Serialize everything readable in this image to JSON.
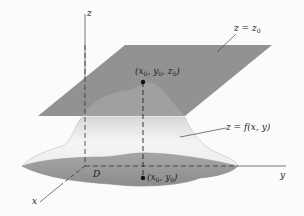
{
  "figure": {
    "type": "3d-surface-diagram",
    "axes": {
      "z_label": "z",
      "y_label": "y",
      "x_label": "x"
    },
    "plane_label": {
      "lhs": "z = z",
      "sub": "0"
    },
    "surface_label": "z = f(x, y)",
    "domain_label": "D",
    "max_point_label": {
      "open": "(x",
      "s1": "0",
      "mid1": ", y",
      "s2": "0",
      "mid2": ", z",
      "s3": "0",
      "close": ")"
    },
    "base_point_label": {
      "open": "(x",
      "s1": "0",
      "mid1": ", y",
      "s2": "0",
      "close": ")"
    },
    "colors": {
      "plane": "#8e8e8e",
      "surface_light": "#f2f2f2",
      "surface_shade": "#cfcfcf",
      "domain": "#9a9a9a",
      "axis": "#444444",
      "point": "#111111"
    }
  }
}
